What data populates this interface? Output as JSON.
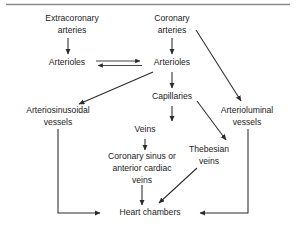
{
  "figure": {
    "type": "flowchart",
    "background_color": "#ffffff",
    "text_color": "#1c1c1c",
    "edge_color": "#2b2b2b",
    "rule_color": "#8a8a8a",
    "has_top_rule": true
  },
  "nodes": {
    "extracoronary_arteries": {
      "lines": [
        "Extracoronary",
        "arteries"
      ],
      "x": 72,
      "y": 24
    },
    "coronary_arteries": {
      "lines": [
        "Coronary",
        "arteries"
      ],
      "x": 172,
      "y": 24
    },
    "arterioles_left": {
      "lines": [
        "Arterioles"
      ],
      "x": 63,
      "y": 63
    },
    "arterioles_right": {
      "lines": [
        "Arterioles"
      ],
      "x": 172,
      "y": 63
    },
    "capillaries": {
      "lines": [
        "Capillaries"
      ],
      "x": 172,
      "y": 97
    },
    "arteriosinusoidal_vessels": {
      "lines": [
        "Arteriosinusoidal",
        "vessels"
      ],
      "x": 58,
      "y": 116
    },
    "arterioluminal_vessels": {
      "lines": [
        "Arterioluminal",
        "vessels"
      ],
      "x": 245,
      "y": 116
    },
    "veins": {
      "lines": [
        "Veins"
      ],
      "x": 172,
      "y": 130
    },
    "thebesian_veins": {
      "lines": [
        "Thebesian",
        "veins"
      ],
      "x": 207,
      "y": 153
    },
    "coronary_sinus": {
      "lines": [
        "Coronary sinus or",
        "anterior cardiac",
        "veins"
      ],
      "x": 139,
      "y": 160
    },
    "heart_chambers": {
      "lines": [
        "Heart chambers"
      ],
      "x": 148,
      "y": 214
    }
  },
  "edges": [
    {
      "id": "extracoronary-to-arterioles-left",
      "from": "extracoronary_arteries",
      "to": "arterioles_left",
      "style": "straight-arrow"
    },
    {
      "id": "coronary-to-arterioles-right",
      "from": "coronary_arteries",
      "to": "arterioles_right",
      "style": "straight-arrow"
    },
    {
      "id": "arterioles-right-to-arterioles-left",
      "from": "arterioles_right",
      "to": "arterioles_left",
      "style": "double-arrow-bidirectional"
    },
    {
      "id": "coronary-to-arterioluminal",
      "from": "coronary_arteries",
      "to": "arterioluminal_vessels",
      "style": "diagonal-arrow"
    },
    {
      "id": "arterioles-right-to-arteriosinusoidal",
      "from": "arterioles_right",
      "to": "arteriosinusoidal_vessels",
      "style": "diagonal-arrow"
    },
    {
      "id": "arterioles-right-to-capillaries",
      "from": "arterioles_right",
      "to": "capillaries",
      "style": "straight-arrow"
    },
    {
      "id": "capillaries-to-veins",
      "from": "capillaries",
      "to": "veins",
      "style": "straight-arrow"
    },
    {
      "id": "capillaries-to-thebesian",
      "from": "capillaries",
      "to": "thebesian_veins",
      "style": "diagonal-arrow"
    },
    {
      "id": "veins-to-coronary-sinus",
      "from": "veins",
      "to": "coronary_sinus",
      "style": "straight-arrow"
    },
    {
      "id": "coronary-sinus-to-heart",
      "from": "coronary_sinus",
      "to": "heart_chambers",
      "style": "straight-arrow"
    },
    {
      "id": "thebesian-to-heart",
      "from": "thebesian_veins",
      "to": "heart_chambers",
      "style": "diagonal-arrow"
    },
    {
      "id": "arteriosinusoidal-to-heart",
      "from": "arteriosinusoidal_vessels",
      "to": "heart_chambers",
      "style": "elbow-arrow-left"
    },
    {
      "id": "arterioluminal-to-heart",
      "from": "arterioluminal_vessels",
      "to": "heart_chambers",
      "style": "elbow-arrow-right"
    }
  ]
}
